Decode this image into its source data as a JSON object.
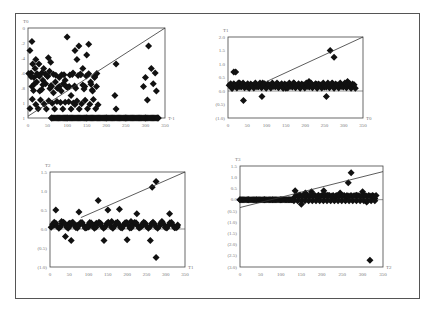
{
  "chart_data": [
    {
      "type": "scatter",
      "title": "T0",
      "ylabel": "T0",
      "xlabel": "T-1",
      "xlim": [
        0,
        350
      ],
      "ylim": [
        0,
        1.0
      ],
      "x_ticks": [
        "0",
        "50",
        "100",
        "150",
        "200",
        "250",
        "300",
        "350"
      ],
      "y_ticks": [
        "0",
        ".2",
        ".4",
        ".6",
        ".8",
        "1",
        "1"
      ],
      "trendline": {
        "x": [
          0,
          350
        ],
        "y": [
          0.02,
          1.0
        ]
      },
      "series": [
        {
          "name": "points",
          "points": [
            [
              5,
              0.75
            ],
            [
              8,
              0.5
            ],
            [
              12,
              0.6
            ],
            [
              10,
              0.35
            ],
            [
              15,
              0.45
            ],
            [
              18,
              0.55
            ],
            [
              22,
              0.4
            ],
            [
              25,
              0.48
            ],
            [
              28,
              0.6
            ],
            [
              30,
              0.3
            ],
            [
              35,
              0.5
            ],
            [
              38,
              0.42
            ],
            [
              40,
              0.55
            ],
            [
              45,
              0.38
            ],
            [
              50,
              0.46
            ],
            [
              55,
              0.52
            ],
            [
              58,
              0.62
            ],
            [
              60,
              0.35
            ],
            [
              65,
              0.28
            ],
            [
              70,
              0.4
            ],
            [
              75,
              0.33
            ],
            [
              80,
              0.45
            ],
            [
              85,
              0.3
            ],
            [
              90,
              0.38
            ],
            [
              95,
              0.42
            ],
            [
              100,
              0.9
            ],
            [
              105,
              0.35
            ],
            [
              110,
              0.25
            ],
            [
              115,
              0.5
            ],
            [
              120,
              0.15
            ],
            [
              125,
              0.65
            ],
            [
              130,
              0.8
            ],
            [
              135,
              0.48
            ],
            [
              140,
              0.55
            ],
            [
              145,
              0.35
            ],
            [
              150,
              0.7
            ],
            [
              155,
              0.82
            ],
            [
              160,
              0.4
            ],
            [
              165,
              0.3
            ],
            [
              170,
              0.45
            ],
            [
              175,
              0.35
            ],
            [
              225,
              0.6
            ],
            [
              222,
              0.25
            ],
            [
              225,
              0.1
            ],
            [
              295,
              0.35
            ],
            [
              300,
              0.45
            ],
            [
              305,
              0.2
            ],
            [
              308,
              0.8
            ],
            [
              315,
              0.55
            ],
            [
              320,
              0.38
            ],
            [
              325,
              0.5
            ],
            [
              328,
              0.3
            ],
            [
              60,
              0.0
            ],
            [
              100,
              0.0
            ],
            [
              150,
              0.0
            ],
            [
              200,
              0.0
            ],
            [
              250,
              0.0
            ],
            [
              300,
              0.0
            ],
            [
              330,
              0.0
            ],
            [
              10,
              0.85
            ],
            [
              20,
              0.65
            ],
            [
              52,
              0.67
            ],
            [
              120,
              0.75
            ]
          ]
        }
      ]
    },
    {
      "type": "scatter",
      "title": "T1",
      "ylabel": "T1",
      "xlabel": "T0",
      "xlim": [
        0,
        350
      ],
      "ylim": [
        -1.0,
        2.0
      ],
      "x_ticks": [
        "0",
        "50",
        "100",
        "150",
        "200",
        "250",
        "300",
        "350"
      ],
      "y_ticks": [
        "2.0",
        "1.5",
        "1.0",
        "0.5",
        "0.0",
        "(0.5)",
        "(1.0)"
      ],
      "trendline": {
        "x": [
          100,
          350
        ],
        "y": [
          0.35,
          2.0
        ]
      },
      "series": [
        {
          "name": "points",
          "points": [
            [
              5,
              0.2
            ],
            [
              15,
              0.7
            ],
            [
              20,
              0.7
            ],
            [
              40,
              -0.35
            ],
            [
              88,
              -0.2
            ],
            [
              255,
              -0.2
            ],
            [
              265,
              1.5
            ],
            [
              275,
              1.25
            ],
            [
              10,
              0.1
            ],
            [
              30,
              0.3
            ],
            [
              50,
              0.15
            ],
            [
              70,
              0.25
            ],
            [
              90,
              0.3
            ],
            [
              110,
              0.2
            ],
            [
              130,
              0.25
            ],
            [
              150,
              0.1
            ],
            [
              170,
              0.3
            ],
            [
              190,
              0.2
            ],
            [
              210,
              0.35
            ],
            [
              230,
              0.25
            ],
            [
              250,
              0.15
            ],
            [
              270,
              0.3
            ],
            [
              290,
              0.2
            ],
            [
              310,
              0.35
            ],
            [
              330,
              0.1
            ]
          ]
        }
      ]
    },
    {
      "type": "scatter",
      "title": "T2",
      "ylabel": "T2",
      "xlabel": "T1",
      "xlim": [
        0,
        350
      ],
      "ylim": [
        -1.0,
        1.5
      ],
      "x_ticks": [
        "0",
        "50",
        "100",
        "150",
        "200",
        "250",
        "300",
        "350"
      ],
      "y_ticks": [
        "1.5",
        "1.0",
        "0.5",
        "0.0",
        "(0.5)",
        "(1.0)"
      ],
      "trendline": {
        "x": [
          80,
          350
        ],
        "y": [
          0.3,
          1.5
        ]
      },
      "series": [
        {
          "name": "points",
          "points": [
            [
              15,
              0.5
            ],
            [
              40,
              -0.2
            ],
            [
              55,
              -0.3
            ],
            [
              75,
              0.45
            ],
            [
              125,
              0.75
            ],
            [
              140,
              -0.3
            ],
            [
              150,
              0.5
            ],
            [
              180,
              0.52
            ],
            [
              200,
              -0.28
            ],
            [
              225,
              0.4
            ],
            [
              260,
              -0.3
            ],
            [
              265,
              1.1
            ],
            [
              275,
              1.25
            ],
            [
              275,
              -0.75
            ],
            [
              10,
              0.1
            ],
            [
              30,
              0.2
            ],
            [
              50,
              0.15
            ],
            [
              70,
              0.1
            ],
            [
              100,
              0.05
            ],
            [
              120,
              0.15
            ],
            [
              160,
              0.2
            ],
            [
              190,
              0.1
            ],
            [
              210,
              0.2
            ],
            [
              240,
              0.1
            ],
            [
              290,
              0.2
            ],
            [
              310,
              0.4
            ],
            [
              330,
              0.05
            ]
          ]
        }
      ]
    },
    {
      "type": "scatter",
      "title": "T3",
      "ylabel": "T3",
      "xlabel": "T2",
      "xlim": [
        0,
        350
      ],
      "ylim": [
        -3.0,
        1.5
      ],
      "x_ticks": [
        "0",
        "50",
        "100",
        "150",
        "200",
        "250",
        "300",
        "350"
      ],
      "y_ticks": [
        "1.5",
        "1.0",
        "0.5",
        "0.0",
        "(0.5)",
        "(1.0)",
        "(1.5)",
        "(2.0)",
        "(2.5)",
        "(3.0)"
      ],
      "trendline": {
        "x": [
          0,
          350
        ],
        "y": [
          -0.35,
          1.25
        ]
      },
      "series": [
        {
          "name": "points",
          "points": [
            [
              0,
              0.0
            ],
            [
              20,
              0.0
            ],
            [
              40,
              0.0
            ],
            [
              60,
              0.0
            ],
            [
              80,
              0.0
            ],
            [
              100,
              0.0
            ],
            [
              120,
              0.0
            ],
            [
              135,
              0.4
            ],
            [
              145,
              0.2
            ],
            [
              150,
              -0.2
            ],
            [
              160,
              0.3
            ],
            [
              175,
              0.35
            ],
            [
              190,
              0.1
            ],
            [
              205,
              0.4
            ],
            [
              215,
              0.2
            ],
            [
              230,
              0.05
            ],
            [
              245,
              0.3
            ],
            [
              260,
              0.1
            ],
            [
              265,
              0.75
            ],
            [
              272,
              1.2
            ],
            [
              285,
              0.2
            ],
            [
              300,
              0.35
            ],
            [
              310,
              -0.1
            ],
            [
              318,
              -2.7
            ],
            [
              330,
              0.05
            ]
          ]
        }
      ]
    }
  ]
}
